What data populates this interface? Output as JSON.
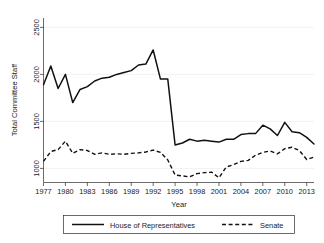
{
  "chart_data": {
    "type": "line",
    "title": "",
    "xlabel": "Year",
    "ylabel": "Total Committee Staff",
    "xlim": [
      1977,
      2014
    ],
    "ylim": [
      850,
      2600
    ],
    "grid": true,
    "legend_position": "bottom",
    "xticks": [
      "1977",
      "1980",
      "1983",
      "1986",
      "1989",
      "1992",
      "1995",
      "1998",
      "2001",
      "2004",
      "2007",
      "2010",
      "2013"
    ],
    "xtick_values": [
      1977,
      1980,
      1983,
      1986,
      1989,
      1992,
      1995,
      1998,
      2001,
      2004,
      2007,
      2010,
      2013
    ],
    "yticks": [
      "1000",
      "1500",
      "2000",
      "2500"
    ],
    "ytick_values": [
      1000,
      1500,
      2000,
      2500
    ],
    "x": [
      1977,
      1978,
      1979,
      1980,
      1981,
      1982,
      1983,
      1984,
      1985,
      1986,
      1987,
      1988,
      1989,
      1990,
      1991,
      1992,
      1993,
      1994,
      1995,
      1996,
      1997,
      1998,
      1999,
      2000,
      2001,
      2002,
      2003,
      2004,
      2005,
      2006,
      2007,
      2008,
      2009,
      2010,
      2011,
      2012,
      2013,
      2014
    ],
    "series": [
      {
        "name": "House of Representatives",
        "style": "solid",
        "color": "#111111",
        "values": [
          1890,
          2090,
          1850,
          2000,
          1700,
          1840,
          1870,
          1930,
          1960,
          1970,
          2000,
          2020,
          2040,
          2100,
          2110,
          2260,
          1950,
          1950,
          1250,
          1270,
          1310,
          1290,
          1300,
          1290,
          1280,
          1310,
          1310,
          1360,
          1370,
          1370,
          1460,
          1420,
          1350,
          1490,
          1390,
          1380,
          1330,
          1260
        ]
      },
      {
        "name": "Senate",
        "style": "dashed",
        "color": "#111111",
        "values": [
          1075,
          1180,
          1200,
          1290,
          1160,
          1200,
          1190,
          1150,
          1165,
          1150,
          1155,
          1150,
          1160,
          1165,
          1175,
          1195,
          1170,
          1090,
          930,
          920,
          910,
          945,
          955,
          960,
          900,
          1015,
          1040,
          1075,
          1085,
          1140,
          1170,
          1185,
          1155,
          1210,
          1225,
          1190,
          1095,
          1120
        ]
      }
    ],
    "legend": [
      {
        "label": "House of Representatives",
        "style": "solid"
      },
      {
        "label": "Senate",
        "style": "dashed"
      }
    ]
  }
}
